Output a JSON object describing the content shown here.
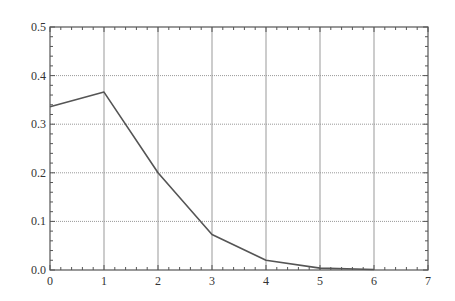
{
  "chart_data": {
    "type": "line",
    "title": "",
    "xlabel": "",
    "ylabel": "",
    "xlim": [
      0,
      7
    ],
    "ylim": [
      0,
      0.5
    ],
    "x_ticks": [
      0,
      1,
      2,
      3,
      4,
      5,
      6,
      7
    ],
    "x_tick_labels": [
      "0",
      "1",
      "2",
      "3",
      "4",
      "5",
      "6",
      "7"
    ],
    "y_ticks": [
      0.0,
      0.1,
      0.2,
      0.3,
      0.4,
      0.5
    ],
    "y_tick_labels": [
      "0.0",
      "0.1",
      "0.2",
      "0.3",
      "0.4",
      "0.5"
    ],
    "x_minor_per_major": 5,
    "y_minor_per_major": 5,
    "grid": true,
    "grid_style": {
      "vertical": "solid",
      "horizontal": "dotted"
    },
    "legend": "none",
    "series": [
      {
        "name": "series-1",
        "color": "#555555",
        "x": [
          0,
          1,
          2,
          3,
          4,
          5,
          6
        ],
        "y": [
          0.336,
          0.366,
          0.2,
          0.073,
          0.02,
          0.004,
          0.001
        ]
      }
    ]
  },
  "colors": {
    "axis": "#555555",
    "grid": "#999999",
    "background": "#ffffff"
  }
}
